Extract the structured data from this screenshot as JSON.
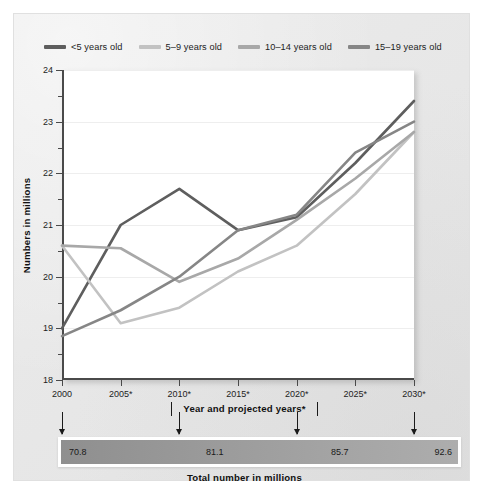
{
  "legend": {
    "items": [
      {
        "label": "<5 years old",
        "color": "#5e5e5e"
      },
      {
        "label": "5–9 years old",
        "color": "#c2c2c2"
      },
      {
        "label": "10–14 years old",
        "color": "#a8a8a8"
      },
      {
        "label": "15–19 years old",
        "color": "#868686"
      }
    ]
  },
  "axes": {
    "y_title": "Numbers in millions",
    "x_title": "Year and projected years*",
    "y_ticks": [
      "24",
      "23",
      "22",
      "21",
      "20",
      "19",
      "18"
    ],
    "x_ticks": [
      "2000",
      "2005*",
      "2010*",
      "2015*",
      "2020*",
      "2025*",
      "2030*"
    ]
  },
  "total_bar": {
    "caption": "Total number in millions",
    "values": [
      "70.8",
      "81.1",
      "85.7",
      "92.6"
    ],
    "start_color": "#8f8f8f",
    "end_color": "#adadad"
  },
  "chart_data": {
    "type": "line",
    "title": "",
    "xlabel": "Year and projected years*",
    "ylabel": "Numbers in millions",
    "categories": [
      "2000",
      "2005*",
      "2010*",
      "2015*",
      "2020*",
      "2025*",
      "2030*"
    ],
    "x_numeric": [
      2000,
      2005,
      2010,
      2015,
      2020,
      2025,
      2030
    ],
    "ylim": [
      18,
      24
    ],
    "ytick_step": 1,
    "yminor_step": 0.5,
    "grid": true,
    "legend_position": "top",
    "series": [
      {
        "name": "<5 years old",
        "color": "#5e5e5e",
        "values": [
          19.0,
          21.0,
          21.7,
          20.9,
          21.15,
          22.2,
          23.4
        ]
      },
      {
        "name": "5–9 years old",
        "color": "#c2c2c2",
        "values": [
          20.6,
          19.1,
          19.4,
          20.1,
          20.6,
          21.6,
          22.8
        ]
      },
      {
        "name": "10–14 years old",
        "color": "#a8a8a8",
        "values": [
          20.6,
          20.55,
          19.9,
          20.35,
          21.1,
          21.9,
          22.8
        ]
      },
      {
        "name": "15–19 years old",
        "color": "#868686",
        "values": [
          18.85,
          19.35,
          20.0,
          20.9,
          21.2,
          22.4,
          23.0
        ]
      }
    ],
    "annotations": {
      "total_number_in_millions": {
        "2000": 70.8,
        "2010*": 81.1,
        "2020*": 85.7,
        "2030*": 92.6
      }
    }
  }
}
